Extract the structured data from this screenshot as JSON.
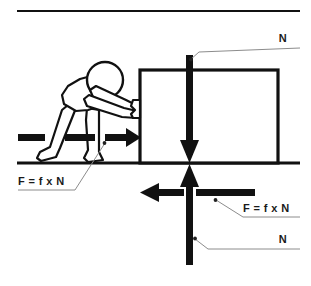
{
  "figure": {
    "title": "Friction force diagram: person pushing a block",
    "background_color": "#ffffff",
    "ink_color": "#111111",
    "leader_color": "#8c8c8c"
  },
  "rules": {
    "top_rule": {
      "name": "top-horizontal-rule",
      "x1": 17,
      "y1": 11,
      "x2": 300,
      "y2": 11
    },
    "ground_line": {
      "name": "ground-surface-line",
      "x1": 17,
      "y1": 163,
      "x2": 300,
      "y2": 163
    }
  },
  "block": {
    "name": "block",
    "x": 140,
    "y": 70,
    "width": 138,
    "height": 93,
    "stroke_width": 3.2
  },
  "person": {
    "name": "person-pushing",
    "head_cx": 105,
    "head_cy": 80,
    "head_r": 18
  },
  "arrows": {
    "applied_force": {
      "name": "applied-force-arrow-right",
      "direction": "right",
      "label_key": "friction_left_label"
    },
    "normal_down": {
      "name": "normal-force-arrow-down",
      "direction": "down"
    },
    "normal_up": {
      "name": "normal-reaction-arrow-up",
      "direction": "up"
    },
    "friction_left": {
      "name": "friction-force-arrow-left",
      "direction": "left"
    }
  },
  "labels": {
    "normal_top": {
      "name": "label-normal-top",
      "text": "N",
      "x": 283,
      "y": 42
    },
    "friction_left_label": {
      "name": "label-friction-left",
      "text": "F = f x N",
      "x": 18,
      "y": 185
    },
    "friction_right_label": {
      "name": "label-friction-right",
      "text": "F = f x N",
      "x": 243,
      "y": 212
    },
    "normal_bottom": {
      "name": "label-normal-bottom",
      "text": "N",
      "x": 283,
      "y": 243
    }
  },
  "equation": {
    "force": "F",
    "equals": "=",
    "coefficient": "f",
    "times": "x",
    "normal": "N",
    "full": "F = f x N"
  }
}
